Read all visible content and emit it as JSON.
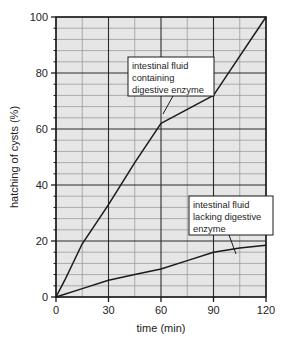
{
  "chart_data": {
    "type": "line",
    "title": "",
    "xlabel": "time (min)",
    "ylabel": "hatching of cysts (%)",
    "xlim": [
      0,
      120
    ],
    "ylim": [
      0,
      100
    ],
    "x_ticks": [
      0,
      30,
      60,
      90,
      120
    ],
    "x_tick_labels": [
      "0",
      "30",
      "60",
      "90",
      "120"
    ],
    "y_ticks": [
      0,
      20,
      40,
      60,
      80,
      100
    ],
    "y_tick_labels": [
      "0",
      "20",
      "40",
      "60",
      "80",
      "100"
    ],
    "x_minor_step": 15,
    "y_minor_step": 4,
    "grid": true,
    "legend_position": "annotations-on-plot",
    "plot_background": "#e6e6e6",
    "line_color": "#1a1a1a",
    "series": [
      {
        "name": "intestinal fluid containing digestive enzyme",
        "x": [
          0,
          5,
          15,
          30,
          45,
          60,
          75,
          90,
          105,
          120
        ],
        "values": [
          0,
          6,
          19,
          33,
          48,
          62,
          67,
          72,
          86,
          100
        ]
      },
      {
        "name": "intestinal fluid lacking digestive enzyme",
        "x": [
          0,
          15,
          30,
          45,
          60,
          75,
          90,
          105,
          120
        ],
        "values": [
          0,
          3,
          6,
          8,
          10,
          13,
          16,
          17.5,
          18.5
        ]
      }
    ],
    "annotations": [
      {
        "id": "annotation-enzyme",
        "lines": [
          "intestinal fluid",
          "containing",
          "digestive enzyme"
        ],
        "box_x": 128,
        "box_y": 57,
        "box_w": 86,
        "box_h": 39,
        "leader_from_x": 173,
        "leader_from_y": 96,
        "leader_to_x": 163,
        "leader_to_y": 114
      },
      {
        "id": "annotation-no-enzyme",
        "lines": [
          "intestinal fluid",
          "lacking digestive",
          "enzyme"
        ],
        "box_x": 189,
        "box_y": 196,
        "box_w": 84,
        "box_h": 39,
        "leader_from_x": 229,
        "leader_from_y": 235,
        "leader_to_x": 236,
        "leader_to_y": 254
      }
    ]
  },
  "axes": {
    "x_title": "time (min)",
    "y_title": "hatching of cysts (%)"
  }
}
